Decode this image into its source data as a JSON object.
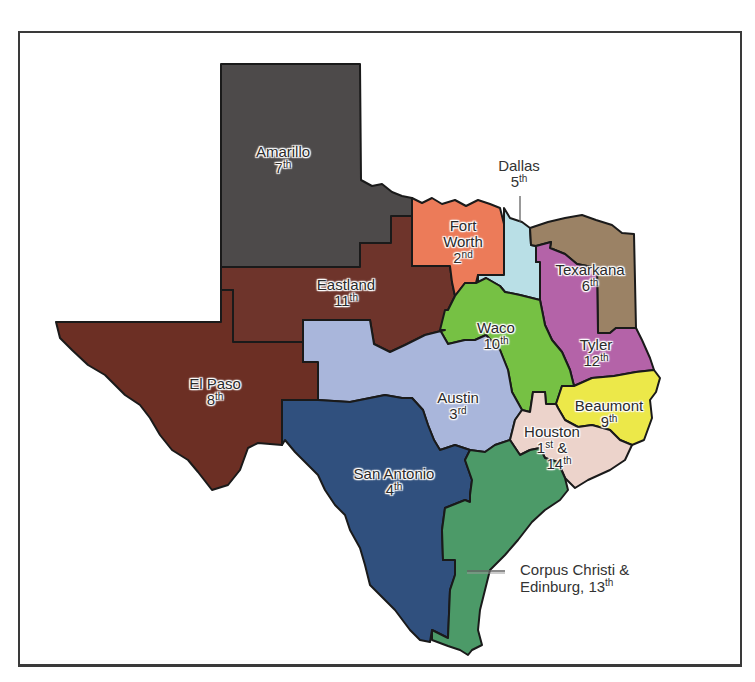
{
  "map": {
    "title": "Texas Courts of Appeals Districts",
    "regions": [
      {
        "name": "Amarillo",
        "number": "7",
        "suffix": "th",
        "color": "#4d4a4a"
      },
      {
        "name": "Eastland",
        "number": "11",
        "suffix": "th",
        "color": "#6e342b"
      },
      {
        "name": "El Paso",
        "number": "8",
        "suffix": "th",
        "color": "#6c2f24"
      },
      {
        "name": "Fort Worth",
        "number": "2",
        "suffix": "nd",
        "color": "#ec7b59"
      },
      {
        "name": "Dallas",
        "number": "5",
        "suffix": "th",
        "color": "#b9dfe6"
      },
      {
        "name": "Texarkana",
        "number": "6",
        "suffix": "th",
        "color": "#9b8265"
      },
      {
        "name": "Waco",
        "number": "10",
        "suffix": "th",
        "color": "#76c144"
      },
      {
        "name": "Tyler",
        "number": "12",
        "suffix": "th",
        "color": "#b463a8"
      },
      {
        "name": "Austin",
        "number": "3",
        "suffix": "rd",
        "color": "#a9b6db"
      },
      {
        "name": "Beaumont",
        "number": "9",
        "suffix": "th",
        "color": "#ece849"
      },
      {
        "name": "Houston",
        "number": "1",
        "suffix": "st",
        "number2": "14",
        "suffix2": "th",
        "color": "#ecd3cb"
      },
      {
        "name": "San Antonio",
        "number": "4",
        "suffix": "th",
        "color": "#30507e"
      },
      {
        "name": "Corpus Christi & Edinburg",
        "number": "13",
        "suffix": "th",
        "color": "#4c9a68"
      }
    ],
    "labels": {
      "amarillo": {
        "name": "Amarillo",
        "num": "7",
        "sup": "th"
      },
      "eastland": {
        "name": "Eastland",
        "num": "11",
        "sup": "th"
      },
      "elpaso": {
        "name": "El Paso",
        "num": "8",
        "sup": "th"
      },
      "fortworth": {
        "name1": "Fort",
        "name2": "Worth",
        "num": "2",
        "sup": "nd"
      },
      "dallas": {
        "name": "Dallas",
        "num": "5",
        "sup": "th"
      },
      "texarkana": {
        "name": "Texarkana",
        "num": "6",
        "sup": "th"
      },
      "waco": {
        "name": "Waco",
        "num": "10",
        "sup": "th"
      },
      "tyler": {
        "name": "Tyler",
        "num": "12",
        "sup": "th"
      },
      "austin": {
        "name": "Austin",
        "num": "3",
        "sup": "rd"
      },
      "beaumont": {
        "name": "Beaumont",
        "num": "9",
        "sup": "th"
      },
      "houston": {
        "name": "Houston",
        "num1": "1",
        "sup1": "st",
        "amp": "&",
        "num2": "14",
        "sup2": "th"
      },
      "sanantonio": {
        "name": "San Antonio",
        "num": "4",
        "sup": "th"
      },
      "corpus": {
        "line1": "Corpus Christi &",
        "line2": "Edinburg, 13",
        "sup": "th"
      }
    }
  }
}
